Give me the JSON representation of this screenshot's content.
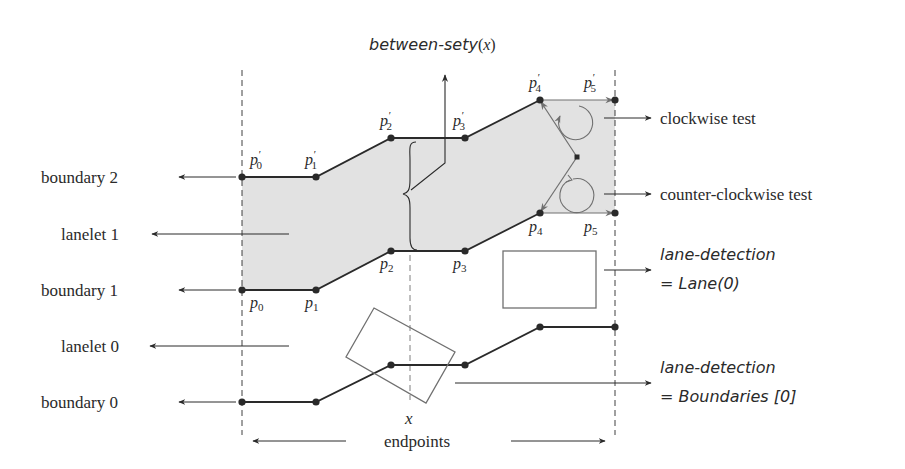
{
  "diagram": {
    "colors": {
      "ink": "#2a2a2a",
      "lane_fill": "#e2e2e2",
      "gray_line": "#707070",
      "background": "#ffffff"
    },
    "labels_left": {
      "boundary_2": "boundary 2",
      "lanelet_1": "lanelet 1",
      "boundary_1": "boundary 1",
      "lanelet_0": "lanelet 0",
      "boundary_0": "boundary 0"
    },
    "labels_right": {
      "clockwise": "clockwise test",
      "counter_clockwise": "counter-clockwise test",
      "lane_detection_1_line1": "lane-detection",
      "lane_detection_1_line2": "= Lane(0)",
      "lane_detection_2_line1": "lane-detection",
      "lane_detection_2_line2": "= Boundaries [0]"
    },
    "top_label": {
      "fn": "between-sety",
      "arg_open": "(",
      "arg": "x",
      "arg_close": ")"
    },
    "bottom": {
      "x_label": "x",
      "endpoints": "endpoints"
    },
    "boundary_2_points": [
      {
        "name": "p",
        "sub": "0",
        "prime": "′"
      },
      {
        "name": "p",
        "sub": "1",
        "prime": "′"
      },
      {
        "name": "p",
        "sub": "2",
        "prime": "′"
      },
      {
        "name": "p",
        "sub": "3",
        "prime": "′"
      },
      {
        "name": "p",
        "sub": "4",
        "prime": "′"
      },
      {
        "name": "p",
        "sub": "5",
        "prime": "′"
      }
    ],
    "boundary_1_points": [
      {
        "name": "p",
        "sub": "0"
      },
      {
        "name": "p",
        "sub": "1"
      },
      {
        "name": "p",
        "sub": "2"
      },
      {
        "name": "p",
        "sub": "3"
      },
      {
        "name": "p",
        "sub": "4"
      },
      {
        "name": "p",
        "sub": "5"
      }
    ]
  }
}
